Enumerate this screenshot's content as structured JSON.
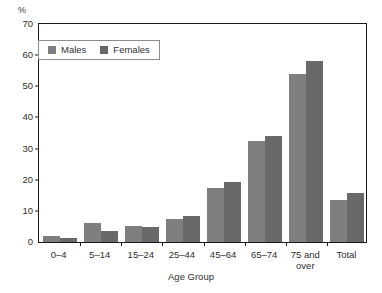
{
  "chart_data": {
    "type": "bar",
    "title": "",
    "xlabel": "Age Group",
    "ylabel": "%",
    "ylim": [
      0,
      70
    ],
    "yticks": [
      0,
      10,
      20,
      30,
      40,
      50,
      60,
      70
    ],
    "grid": false,
    "legend_position": "top-left-inside",
    "categories": [
      "0–4",
      "5–14",
      "15–24",
      "25–44",
      "45–64",
      "65–74",
      "75 and\nover",
      "Total"
    ],
    "series": [
      {
        "name": "Males",
        "color": "#807f7f",
        "values": [
          2.0,
          6.0,
          5.0,
          7.5,
          17.5,
          32.5,
          54.0,
          13.5
        ]
      },
      {
        "name": "Females",
        "color": "#6a6969",
        "values": [
          1.3,
          3.5,
          4.7,
          8.4,
          19.4,
          34.0,
          58.0,
          15.6
        ]
      }
    ]
  },
  "axis": {
    "y_unit_label": "%",
    "x_axis_title": "Age Group"
  },
  "legend": {
    "items": [
      {
        "label": "Males",
        "color": "#807f7f"
      },
      {
        "label": "Females",
        "color": "#6a6969"
      }
    ]
  }
}
